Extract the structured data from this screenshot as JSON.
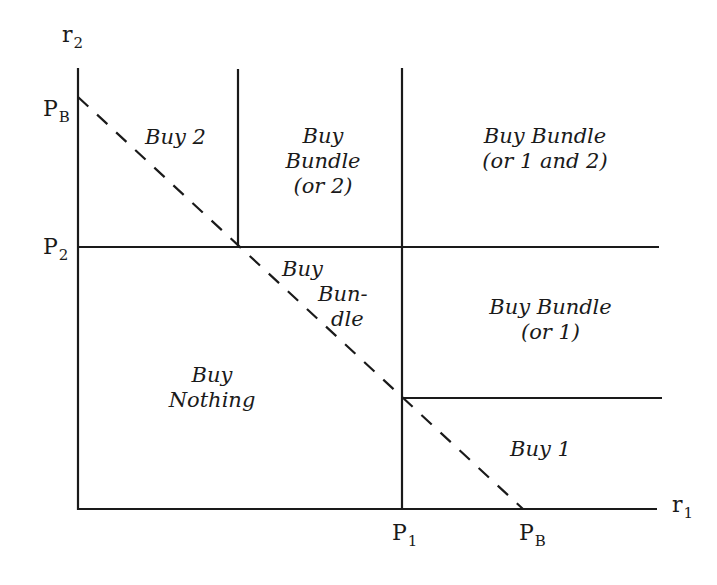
{
  "axes": {
    "x": {
      "label": "r",
      "label_sub": "1"
    },
    "y": {
      "label": "r",
      "label_sub": "2"
    }
  },
  "ticks": {
    "y_PB": {
      "main": "P",
      "sub": "B"
    },
    "y_P2": {
      "main": "P",
      "sub": "2"
    },
    "x_P1": {
      "main": "P",
      "sub": "1"
    },
    "x_PB": {
      "main": "P",
      "sub": "B"
    }
  },
  "regions": {
    "buy_2": {
      "lines": [
        "Buy 2"
      ]
    },
    "buy_bundle_or_2": {
      "lines": [
        "Buy",
        "Bundle",
        "(or 2)"
      ]
    },
    "buy_bundle_or_1_and_2": {
      "lines": [
        "Buy Bundle",
        "(or 1 and 2)"
      ]
    },
    "buy_bundle_middle": {
      "lines": [
        "Buy",
        "Bun-",
        "dle"
      ]
    },
    "buy_bundle_or_1": {
      "lines": [
        "Buy Bundle",
        "(or 1)"
      ]
    },
    "buy_nothing": {
      "lines": [
        "Buy",
        "Nothing"
      ]
    },
    "buy_1": {
      "lines": [
        "Buy 1"
      ]
    }
  },
  "colors": {
    "line": "#1a1a1a",
    "background": "#ffffff"
  }
}
